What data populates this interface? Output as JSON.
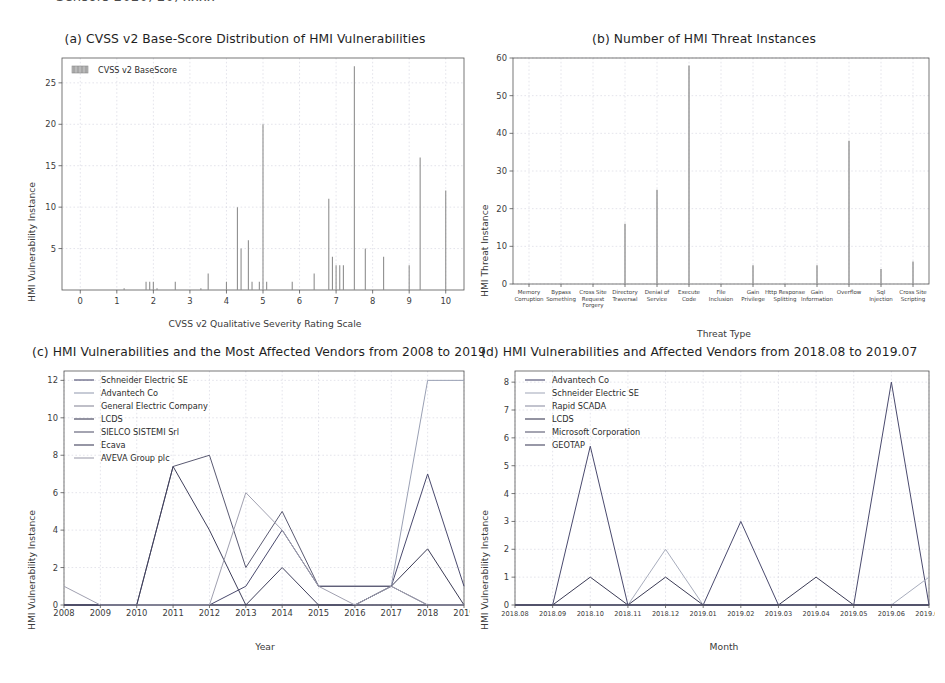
{
  "page": {
    "cutoff_header": "Sensors 2020, 20, xxxx"
  },
  "panels": {
    "a": {
      "title": "(a) CVSS v2 Base-Score Distribution of HMI Vulnerabilities",
      "legend_label": "CVSS v2 BaseScore",
      "xlabel": "CVSS v2 Qualitative Severity Rating Scale",
      "ylabel": "HMI Vulnerability Instance"
    },
    "b": {
      "title": "(b) Number of HMI Threat Instances",
      "xlabel": "Threat Type",
      "ylabel": "HMI Threat Instance"
    },
    "c": {
      "title": "(c) HMI Vulnerabilities and the Most Affected Vendors from 2008 to 2019",
      "xlabel": "Year",
      "ylabel": "HMI Vulnerability Instance"
    },
    "d": {
      "title": "(d) HMI Vulnerabilities and Affected Vendors from 2018.08 to 2019.07",
      "xlabel": "Month",
      "ylabel": "HMI Vulnerability Instance"
    }
  },
  "colors": {
    "bar_a": "#8f8f8f",
    "bar_b": "#9a9a9a",
    "grid": "#c9c9d6",
    "axis": "#555555",
    "series_c": [
      "#4a4a6e",
      "#9aa0b4",
      "#8a8a9c",
      "#3b3b55",
      "#5a5a72",
      "#40405c",
      "#a0a0b0"
    ],
    "series_d": [
      "#4a4a6e",
      "#a8adbd",
      "#9093a6",
      "#3b3b55",
      "#5a5a72",
      "#44445f"
    ]
  },
  "chart_data": [
    {
      "id": "a",
      "type": "bar",
      "title": "(a) CVSS v2 Base-Score Distribution of HMI Vulnerabilities",
      "xlabel": "CVSS v2 Qualitative Severity Rating Scale",
      "ylabel": "HMI Vulnerability Instance",
      "legend": [
        "CVSS v2 BaseScore"
      ],
      "legend_position": "upper-left",
      "grid": true,
      "xlim": [
        -0.5,
        10.5
      ],
      "ylim": [
        0,
        28
      ],
      "xticks": [
        0,
        1,
        2,
        3,
        4,
        5,
        6,
        7,
        8,
        9,
        10
      ],
      "yticks": [
        5,
        10,
        15,
        20,
        25
      ],
      "x": [
        1.2,
        1.8,
        1.9,
        2.0,
        2.1,
        2.6,
        3.3,
        3.5,
        4.0,
        4.3,
        4.4,
        4.6,
        4.7,
        4.9,
        5.0,
        5.1,
        5.8,
        6.4,
        6.8,
        6.9,
        7.0,
        7.1,
        7.2,
        7.5,
        7.8,
        8.3,
        9.0,
        9.3,
        10.0
      ],
      "values": [
        0.2,
        1,
        1,
        1,
        0.2,
        1,
        0.2,
        2,
        1,
        10,
        5,
        6,
        1,
        1,
        20,
        1,
        1,
        2,
        11,
        4,
        3,
        3,
        3,
        27,
        5,
        4,
        3,
        16,
        12
      ]
    },
    {
      "id": "b",
      "type": "bar",
      "title": "(b) Number of HMI Threat Instances",
      "xlabel": "Threat Type",
      "ylabel": "HMI Threat Instance",
      "grid": true,
      "ylim": [
        0,
        60
      ],
      "yticks": [
        0,
        10,
        20,
        30,
        40,
        50,
        60
      ],
      "categories": [
        "Memory Corruption",
        "Bypass Something",
        "Cross Site Request Forgery",
        "Directory Traversal",
        "Denial of Service",
        "Execute Code",
        "File Inclusion",
        "Gain Privilege",
        "Http Response Splitting",
        "Gain Information",
        "Overflow",
        "Sql Injection",
        "Cross Site Scripting"
      ],
      "values": [
        0,
        0,
        0,
        16,
        25,
        58,
        0,
        5,
        0,
        5,
        38,
        4,
        6
      ]
    },
    {
      "id": "c",
      "type": "line",
      "title": "(c) HMI Vulnerabilities and the Most Affected Vendors from 2008 to 2019",
      "xlabel": "Year",
      "ylabel": "HMI Vulnerability Instance",
      "grid": true,
      "legend_position": "upper-left",
      "ylim": [
        0,
        12.5
      ],
      "yticks": [
        0,
        2,
        4,
        6,
        8,
        10,
        12
      ],
      "categories": [
        "2008",
        "2009",
        "2010",
        "2011",
        "2012",
        "2013",
        "2014",
        "2015",
        "2016",
        "2017",
        "2018",
        "2019"
      ],
      "series": [
        {
          "name": "Schneider Electric SE",
          "values": [
            0,
            0,
            0,
            0,
            0,
            1,
            4,
            1,
            1,
            1,
            7,
            1
          ]
        },
        {
          "name": "Advantech Co",
          "values": [
            0,
            0,
            0,
            0,
            0,
            0,
            0,
            0,
            0,
            1,
            12,
            12
          ]
        },
        {
          "name": "General Electric Company",
          "values": [
            0,
            0,
            0,
            0,
            0,
            0,
            0,
            0,
            0,
            0,
            0,
            0
          ]
        },
        {
          "name": "LCDS",
          "values": [
            0,
            0,
            0,
            0,
            0,
            0,
            0,
            0,
            0,
            1,
            3,
            0
          ]
        },
        {
          "name": "SIELCO SISTEMI Srl",
          "values": [
            0,
            0,
            0,
            7.4,
            8,
            2,
            5,
            1,
            1,
            1,
            0,
            0
          ]
        },
        {
          "name": "Ecava",
          "values": [
            0,
            0,
            0,
            7.4,
            4,
            0,
            2,
            0,
            0,
            0,
            0,
            0
          ]
        },
        {
          "name": "AVEVA Group plc",
          "values": [
            1,
            0,
            0,
            0,
            0,
            6,
            4,
            1,
            0,
            1,
            0,
            0
          ]
        }
      ]
    },
    {
      "id": "d",
      "type": "line",
      "title": "(d) HMI Vulnerabilities and Affected Vendors from 2018.08 to 2019.07",
      "xlabel": "Month",
      "ylabel": "HMI Vulnerability Instance",
      "grid": true,
      "legend_position": "upper-left",
      "ylim": [
        0,
        8.4
      ],
      "yticks": [
        0,
        1,
        2,
        3,
        4,
        5,
        6,
        7,
        8
      ],
      "categories": [
        "2018.08",
        "2018.09",
        "2018.10",
        "2018.11",
        "2018.12",
        "2019.01",
        "2019.02",
        "2019.03",
        "2019.04",
        "2019.05",
        "2019.06",
        "2019.07"
      ],
      "series": [
        {
          "name": "Advantech Co",
          "values": [
            0,
            0,
            5.7,
            0,
            0,
            0,
            3,
            0,
            0,
            0,
            8,
            0
          ]
        },
        {
          "name": "Schneider Electric SE",
          "values": [
            0,
            0,
            0,
            0,
            2,
            0,
            0,
            0,
            0,
            0,
            0,
            1
          ]
        },
        {
          "name": "Rapid SCADA",
          "values": [
            0,
            0,
            0,
            0,
            0,
            0,
            0,
            0,
            0,
            0,
            0,
            0
          ]
        },
        {
          "name": "LCDS",
          "values": [
            0,
            0,
            1,
            0,
            1,
            0,
            0,
            0,
            1,
            0,
            0,
            0
          ]
        },
        {
          "name": "Microsoft Corporation",
          "values": [
            0,
            0,
            0,
            0,
            0,
            0,
            0,
            0,
            0,
            0,
            0,
            0
          ]
        },
        {
          "name": "GEOTAP",
          "values": [
            0,
            0,
            0,
            0,
            0,
            0,
            0,
            0,
            0,
            0,
            0,
            0
          ]
        }
      ]
    }
  ]
}
